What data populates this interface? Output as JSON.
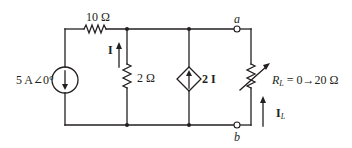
{
  "diagram": {
    "type": "circuit",
    "stroke_color": "#231f20",
    "components": {
      "source": {
        "label": "5 A∠0°",
        "kind": "independent-current-source",
        "direction": "down"
      },
      "series_resistor": {
        "label": "10 Ω"
      },
      "shunt_resistor": {
        "label": "2 Ω"
      },
      "current_I": {
        "label": "I",
        "direction": "up"
      },
      "dependent_source": {
        "label": "2 I",
        "kind": "current-controlled-current-source",
        "direction": "up"
      },
      "load_resistor": {
        "label_main": "R",
        "label_sub": "L",
        "label_range": " = 0→20 Ω",
        "kind": "variable-resistor"
      },
      "load_current": {
        "label_main": "I",
        "label_sub": "L",
        "direction": "up"
      }
    },
    "terminals": {
      "a": "a",
      "b": "b"
    }
  }
}
